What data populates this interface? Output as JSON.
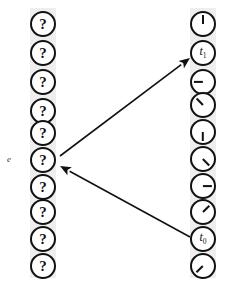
{
  "diagram": {
    "width": 244,
    "height": 289,
    "background_color": "#ffffff",
    "band_color": "#eeeeee",
    "stroke_color": "#111111",
    "left_column": {
      "name": "event-column",
      "band": {
        "x": 30,
        "y": 8,
        "width": 26,
        "height": 270
      },
      "circle_diameter": 26,
      "nodes": [
        {
          "id": "e0",
          "label": "?",
          "cx": 43,
          "cy": 24,
          "side_label": ""
        },
        {
          "id": "e1",
          "label": "?",
          "cx": 43,
          "cy": 53,
          "side_label": ""
        },
        {
          "id": "e2",
          "label": "?",
          "cx": 43,
          "cy": 82,
          "side_label": ""
        },
        {
          "id": "e3",
          "label": "?",
          "cx": 43,
          "cy": 111,
          "side_label": ""
        },
        {
          "id": "e4",
          "label": "?",
          "cx": 43,
          "cy": 133,
          "side_label": ""
        },
        {
          "id": "e5",
          "label": "?",
          "cx": 43,
          "cy": 160,
          "side_label": "e"
        },
        {
          "id": "e6",
          "label": "?",
          "cx": 43,
          "cy": 187,
          "side_label": ""
        },
        {
          "id": "e7",
          "label": "?",
          "cx": 43,
          "cy": 212,
          "side_label": ""
        },
        {
          "id": "e8",
          "label": "?",
          "cx": 43,
          "cy": 239,
          "side_label": ""
        },
        {
          "id": "e9",
          "label": "?",
          "cx": 43,
          "cy": 266,
          "side_label": ""
        }
      ]
    },
    "right_column": {
      "name": "clock-column",
      "band": {
        "x": 190,
        "y": 8,
        "width": 26,
        "height": 270
      },
      "circle_diameter": 26,
      "nodes": [
        {
          "id": "c0",
          "label": "",
          "hand_angle": 0,
          "cx": 203,
          "cy": 24
        },
        {
          "id": "c1",
          "label": "t",
          "sub": "1",
          "hand_angle": null,
          "cx": 203,
          "cy": 53
        },
        {
          "id": "c2",
          "label": "",
          "hand_angle": 270,
          "cx": 203,
          "cy": 82
        },
        {
          "id": "c3",
          "label": "",
          "hand_angle": 315,
          "cx": 203,
          "cy": 105
        },
        {
          "id": "c4",
          "label": "",
          "hand_angle": 180,
          "cx": 203,
          "cy": 132
        },
        {
          "id": "c5",
          "label": "",
          "hand_angle": 135,
          "cx": 203,
          "cy": 159
        },
        {
          "id": "c6",
          "label": "",
          "hand_angle": 90,
          "cx": 203,
          "cy": 186
        },
        {
          "id": "c7",
          "label": "",
          "hand_angle": 45,
          "cx": 203,
          "cy": 212
        },
        {
          "id": "c8",
          "label": "t",
          "sub": "0",
          "hand_angle": null,
          "cx": 203,
          "cy": 239
        },
        {
          "id": "c9",
          "label": "",
          "hand_angle": 225,
          "cx": 203,
          "cy": 266
        }
      ]
    },
    "arrows": [
      {
        "id": "arrow-e-to-t1",
        "name": "arrow-event-to-t1",
        "from": {
          "x": 60,
          "y": 156
        },
        "to": {
          "x": 190,
          "y": 58
        },
        "direction": "to-right"
      },
      {
        "id": "arrow-t0-to-e",
        "name": "arrow-t0-to-event",
        "from": {
          "x": 190,
          "y": 237
        },
        "to": {
          "x": 60,
          "y": 166
        },
        "direction": "to-left"
      }
    ]
  }
}
